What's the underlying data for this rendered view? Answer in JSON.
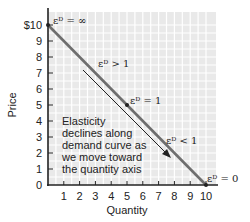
{
  "chart_data": {
    "type": "line",
    "title": "",
    "xlabel": "Quantity",
    "ylabel": "Price",
    "xlim": [
      0,
      10
    ],
    "ylim": [
      0,
      10
    ],
    "x_ticks": [
      "1",
      "2",
      "3",
      "4",
      "5",
      "6",
      "7",
      "8",
      "9",
      "10"
    ],
    "y_ticks": [
      "0",
      "1",
      "2",
      "3",
      "4",
      "5",
      "6",
      "7",
      "8",
      "9",
      "$10"
    ],
    "grid": true,
    "series": [
      {
        "name": "Demand curve",
        "x": [
          0,
          10
        ],
        "y": [
          10,
          0
        ],
        "color": "#6b6b6b"
      }
    ],
    "points": [
      {
        "x": 0,
        "y": 10,
        "label": "εᴰ = ∞"
      },
      {
        "x": 5,
        "y": 5,
        "label": "εᴰ = 1"
      },
      {
        "x": 10,
        "y": 0,
        "label": "εᴰ = 0"
      }
    ],
    "annotations": [
      {
        "text": "εᴰ > 1",
        "x": 3.2,
        "y": 7.3
      },
      {
        "text": "εᴰ < 1",
        "x": 7.6,
        "y": 2.6
      },
      {
        "text": "Elasticity declines along demand curve as we move toward the quantity axis",
        "x": 0.8,
        "y": 4.2
      }
    ]
  },
  "labels": {
    "xlabel": "Quantity",
    "ylabel": "Price",
    "eps_inf": "εᴰ = ∞",
    "eps_gt1": "εᴰ > 1",
    "eps_eq1": "εᴰ = 1",
    "eps_lt1": "εᴰ < 1",
    "eps_zero": "εᴰ = 0",
    "note": [
      "Elasticity",
      "declines along",
      "demand curve as",
      "we move toward",
      "the quantity axis"
    ]
  },
  "ticks": {
    "x": [
      "1",
      "2",
      "3",
      "4",
      "5",
      "6",
      "7",
      "8",
      "9",
      "10"
    ],
    "y": [
      "0",
      "1",
      "2",
      "3",
      "4",
      "5",
      "6",
      "7",
      "8",
      "9",
      "$10"
    ]
  }
}
